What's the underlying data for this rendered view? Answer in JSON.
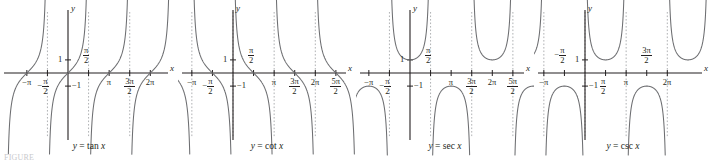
{
  "figure": {
    "caption_note": "FIGURE",
    "axis_x_label": "x",
    "axis_y_label": "y",
    "curve_color": "#6d6e71",
    "axis_color": "#231f20",
    "asymptote_color": "#a7a9ac",
    "background": "#ffffff"
  },
  "panels": [
    {
      "id": "tan",
      "caption": "y = tan x",
      "caption_lhs": "y",
      "caption_eq": "=",
      "caption_fn": "tan",
      "caption_var": "x",
      "y_ticks": [
        {
          "label": "1",
          "value": 1
        },
        {
          "label": "−1",
          "value": -1
        }
      ],
      "x_ticks": [
        {
          "label": "−π",
          "num": "",
          "den": "",
          "value": -3.14159,
          "pos": "below"
        },
        {
          "label": "−",
          "num": "π",
          "den": "2",
          "value": -1.5708,
          "pos": "below"
        },
        {
          "label": "",
          "num": "π",
          "den": "2",
          "value": 1.5708,
          "pos": "above"
        },
        {
          "label": "π",
          "num": "",
          "den": "",
          "value": 3.14159,
          "pos": "below"
        },
        {
          "label": "",
          "num": "3π",
          "den": "2",
          "value": 4.712,
          "pos": "below"
        },
        {
          "label": "2π",
          "num": "",
          "den": "",
          "value": 6.2832,
          "pos": "below"
        }
      ],
      "asymptotes": [
        -1.5708,
        1.5708,
        4.712
      ]
    },
    {
      "id": "cot",
      "caption": "y = cot x",
      "caption_lhs": "y",
      "caption_eq": "=",
      "caption_fn": "cot",
      "caption_var": "x",
      "y_ticks": [
        {
          "label": "1",
          "value": 1
        },
        {
          "label": "−1",
          "value": -1
        }
      ],
      "x_ticks": [
        {
          "label": "−π",
          "num": "",
          "den": "",
          "value": -3.14159,
          "pos": "below"
        },
        {
          "label": "−",
          "num": "π",
          "den": "2",
          "value": -1.5708,
          "pos": "below"
        },
        {
          "label": "",
          "num": "π",
          "den": "2",
          "value": 1.5708,
          "pos": "above"
        },
        {
          "label": "π",
          "num": "",
          "den": "",
          "value": 3.14159,
          "pos": "below"
        },
        {
          "label": "",
          "num": "3π",
          "den": "2",
          "value": 4.712,
          "pos": "below"
        },
        {
          "label": "2π",
          "num": "",
          "den": "",
          "value": 6.2832,
          "pos": "below"
        },
        {
          "label": "",
          "num": "5π",
          "den": "2",
          "value": 7.854,
          "pos": "below"
        }
      ],
      "asymptotes": [
        -3.14159,
        0,
        3.14159,
        6.2832
      ]
    },
    {
      "id": "sec",
      "caption": "y = sec x",
      "caption_lhs": "y",
      "caption_eq": "=",
      "caption_fn": "sec",
      "caption_var": "x",
      "y_ticks": [
        {
          "label": "1",
          "value": 1
        },
        {
          "label": "−1",
          "value": -1
        }
      ],
      "x_ticks": [
        {
          "label": "−π",
          "num": "",
          "den": "",
          "value": -3.14159,
          "pos": "below"
        },
        {
          "label": "−",
          "num": "π",
          "den": "2",
          "value": -1.5708,
          "pos": "below"
        },
        {
          "label": "",
          "num": "π",
          "den": "2",
          "value": 1.5708,
          "pos": "above"
        },
        {
          "label": "π",
          "num": "",
          "den": "",
          "value": 3.14159,
          "pos": "below"
        },
        {
          "label": "",
          "num": "3π",
          "den": "2",
          "value": 4.712,
          "pos": "below"
        },
        {
          "label": "2π",
          "num": "",
          "den": "",
          "value": 6.2832,
          "pos": "below"
        },
        {
          "label": "",
          "num": "5π",
          "den": "2",
          "value": 7.854,
          "pos": "below"
        }
      ],
      "asymptotes": [
        -1.5708,
        1.5708,
        4.712,
        7.854
      ]
    },
    {
      "id": "csc",
      "caption": "y = csc x",
      "caption_lhs": "y",
      "caption_eq": "=",
      "caption_fn": "csc",
      "caption_var": "x",
      "y_ticks": [
        {
          "label": "1",
          "value": 1
        },
        {
          "label": "−1",
          "value": -1
        }
      ],
      "x_ticks": [
        {
          "label": "−π",
          "num": "",
          "den": "",
          "value": -3.14159,
          "pos": "below"
        },
        {
          "label": "−",
          "num": "π",
          "den": "2",
          "value": -1.5708,
          "pos": "above"
        },
        {
          "label": "",
          "num": "π",
          "den": "2",
          "value": 1.5708,
          "pos": "below"
        },
        {
          "label": "π",
          "num": "",
          "den": "",
          "value": 3.14159,
          "pos": "below"
        },
        {
          "label": "",
          "num": "3π",
          "den": "2",
          "value": 4.712,
          "pos": "above"
        },
        {
          "label": "2π",
          "num": "",
          "den": "",
          "value": 6.2832,
          "pos": "below"
        }
      ],
      "asymptotes": [
        -3.14159,
        0,
        3.14159,
        6.2832
      ]
    }
  ],
  "chart_data": {
    "type": "line",
    "xlabel": "x",
    "ylabel": "y",
    "grid": false,
    "legend": "none",
    "xlim": [
      -4.2,
      8.7
    ],
    "ylim": [
      -4.6,
      4.6
    ],
    "subplots": [
      {
        "title": "y = tan x",
        "function": "tan",
        "x_tick_labels": [
          "−π",
          "−π/2",
          "π/2",
          "π",
          "3π/2",
          "2π"
        ],
        "x_tick_values": [
          -3.14159,
          -1.5708,
          1.5708,
          3.14159,
          4.712,
          6.2832
        ],
        "y_tick_labels": [
          "1",
          "−1"
        ],
        "y_tick_values": [
          1,
          -1
        ],
        "asymptotes": [
          -1.5708,
          1.5708,
          4.712
        ],
        "zeros": [
          -3.14159,
          0,
          3.14159,
          6.2832
        ]
      },
      {
        "title": "y = cot x",
        "function": "cot",
        "x_tick_labels": [
          "−π",
          "−π/2",
          "π/2",
          "π",
          "3π/2",
          "2π",
          "5π/2"
        ],
        "x_tick_values": [
          -3.14159,
          -1.5708,
          1.5708,
          3.14159,
          4.712,
          6.2832,
          7.854
        ],
        "y_tick_labels": [
          "1",
          "−1"
        ],
        "y_tick_values": [
          1,
          -1
        ],
        "asymptotes": [
          -3.14159,
          0,
          3.14159,
          6.2832
        ],
        "zeros": [
          -1.5708,
          1.5708,
          4.712,
          7.854
        ]
      },
      {
        "title": "y = sec x",
        "function": "sec",
        "x_tick_labels": [
          "−π",
          "−π/2",
          "π/2",
          "π",
          "3π/2",
          "2π",
          "5π/2"
        ],
        "x_tick_values": [
          -3.14159,
          -1.5708,
          1.5708,
          3.14159,
          4.712,
          6.2832,
          7.854
        ],
        "y_tick_labels": [
          "1",
          "−1"
        ],
        "y_tick_values": [
          1,
          -1
        ],
        "asymptotes": [
          -1.5708,
          1.5708,
          4.712,
          7.854
        ],
        "local_extrema": [
          {
            "x": -3.14159,
            "y": -1
          },
          {
            "x": 0,
            "y": 1
          },
          {
            "x": 3.14159,
            "y": -1
          },
          {
            "x": 6.2832,
            "y": 1
          }
        ]
      },
      {
        "title": "y = csc x",
        "function": "csc",
        "x_tick_labels": [
          "−π",
          "−π/2",
          "π/2",
          "π",
          "3π/2",
          "2π"
        ],
        "x_tick_values": [
          -3.14159,
          -1.5708,
          1.5708,
          3.14159,
          4.712,
          6.2832
        ],
        "y_tick_labels": [
          "1",
          "−1"
        ],
        "y_tick_values": [
          1,
          -1
        ],
        "asymptotes": [
          -3.14159,
          0,
          3.14159,
          6.2832
        ],
        "local_extrema": [
          {
            "x": -1.5708,
            "y": -1
          },
          {
            "x": 1.5708,
            "y": 1
          },
          {
            "x": 4.712,
            "y": -1
          },
          {
            "x": 7.854,
            "y": 1
          }
        ]
      }
    ]
  }
}
